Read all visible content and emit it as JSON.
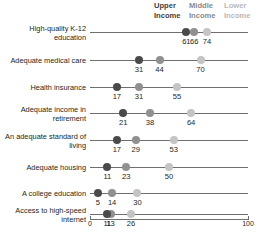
{
  "legend": {
    "groups": [
      {
        "key": "upper",
        "line1": "Upper",
        "line2": "Income",
        "color": "#4a4a4a"
      },
      {
        "key": "middle",
        "line1": "Middle",
        "line2": "Income",
        "color": "#909090"
      },
      {
        "key": "lower",
        "line1": "Lower",
        "line2": "Income",
        "color": "#c4c4c4"
      }
    ]
  },
  "axis": {
    "min_label": "0",
    "max_label": "100"
  },
  "chart_data": {
    "type": "scatter",
    "title": "",
    "xlabel": "",
    "ylabel": "",
    "xlim": [
      0,
      100
    ],
    "grid": false,
    "legend_position": "top-right",
    "categories": [
      "High-quality K-12 education",
      "Adequate medical care",
      "Health insurance",
      "Adequate income in retirement",
      "An adequate standard of living",
      "Adequate housing",
      "A college education",
      "Access to high-speed internet"
    ],
    "category_lines": [
      [
        "High-quality K-12",
        "education"
      ],
      [
        "Adequate medical care"
      ],
      [
        "Health insurance"
      ],
      [
        "Adequate income in",
        "retirement"
      ],
      [
        "An adequate standard of",
        "living"
      ],
      [
        "Adequate housing"
      ],
      [
        "A college education"
      ],
      [
        "Access to high-speed",
        "internet"
      ]
    ],
    "series": [
      {
        "name": "Upper Income",
        "color": "#4a4a4a",
        "values": [
          61,
          31,
          17,
          21,
          17,
          11,
          5,
          11
        ]
      },
      {
        "name": "Middle Income",
        "color": "#909090",
        "values": [
          66,
          44,
          31,
          38,
          29,
          23,
          14,
          13
        ]
      },
      {
        "name": "Lower Income",
        "color": "#c4c4c4",
        "values": [
          74,
          70,
          55,
          64,
          53,
          50,
          30,
          26
        ]
      }
    ]
  }
}
